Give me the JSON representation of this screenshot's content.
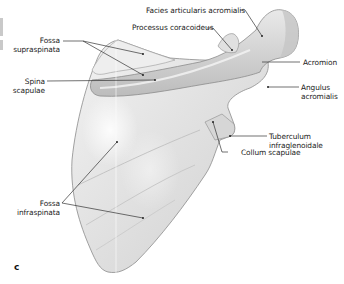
{
  "figure": {
    "panel_letter": "c",
    "labels": {
      "facies_articularis_acromialis": "Facies articularis acromialis",
      "processus_coracoideus": "Processus coracoideus",
      "fossa_supraspinata_1": "Fossa",
      "fossa_supraspinata_2": "supraspinata",
      "spina_scapulae_1": "Spina",
      "spina_scapulae_2": "scapulae",
      "acromion": "Acromion",
      "angulus_acromialis_1": "Angulus",
      "angulus_acromialis_2": "acromialis",
      "tuberculum_infraglenoidale_1": "Tuberculum",
      "tuberculum_infraglenoidale_2": "infraglenoidale",
      "collum_scapulae": "Collum scapulae",
      "fossa_infraspinata_1": "Fossa",
      "fossa_infraspinata_2": "infraspinata"
    },
    "colors": {
      "bone_fill": "#e4e4e4",
      "bone_shadow": "#bdbdbd",
      "bone_outline": "#8c8c8c",
      "leader_line": "#333333",
      "text": "#222222"
    }
  }
}
